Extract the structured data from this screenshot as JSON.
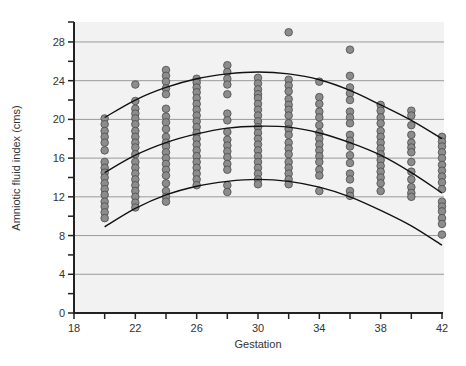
{
  "chart_data": {
    "type": "scatter",
    "title": "",
    "xlabel": "Gestation",
    "ylabel": "Amniotic fluid index (cms)",
    "xlim": [
      18,
      42
    ],
    "ylim": [
      0,
      30
    ],
    "x_ticks": [
      18,
      20,
      22,
      24,
      26,
      28,
      30,
      32,
      34,
      36,
      38,
      40,
      42
    ],
    "x_tick_labels": [
      "18",
      "22",
      "26",
      "30",
      "34",
      "38",
      "42"
    ],
    "x_tick_label_values": [
      18,
      22,
      26,
      30,
      34,
      38,
      42
    ],
    "y_ticks": [
      0,
      2,
      4,
      6,
      8,
      10,
      12,
      14,
      16,
      18,
      20,
      22,
      24,
      26,
      28
    ],
    "y_tick_labels": [
      "0",
      "4",
      "8",
      "12",
      "16",
      "20",
      "24",
      "28"
    ],
    "y_tick_label_values": [
      0,
      4,
      8,
      12,
      16,
      20,
      24,
      28
    ],
    "grid": {
      "horizontal": true,
      "values": [
        4,
        8,
        12,
        16,
        20,
        24,
        28
      ]
    },
    "legend": null,
    "series": [
      {
        "name": "observations",
        "points_by_x": {
          "20": [
            20.1,
            19.5,
            18.8,
            18.2,
            17.6,
            16.8,
            15.6,
            15.0,
            14.5,
            14.0,
            13.4,
            12.8,
            12.2,
            11.5,
            11.0,
            10.4,
            9.8
          ],
          "22": [
            23.6,
            21.9,
            21.1,
            20.6,
            20.1,
            19.5,
            18.8,
            18.2,
            17.6,
            17.1,
            16.4,
            15.6,
            15.0,
            14.4,
            13.8,
            13.2,
            12.6,
            12.0,
            11.4,
            10.9
          ],
          "24": [
            25.1,
            24.5,
            23.9,
            23.2,
            22.6,
            21.1,
            20.3,
            19.7,
            19.0,
            18.2,
            17.6,
            17.2,
            16.6,
            16.0,
            15.4,
            14.8,
            14.2,
            13.4,
            12.6,
            12.0,
            11.5
          ],
          "26": [
            24.2,
            23.8,
            23.3,
            22.8,
            22.2,
            21.6,
            21.0,
            20.4,
            19.8,
            19.2,
            18.6,
            18.0,
            17.4,
            16.8,
            16.2,
            15.6,
            15.0,
            14.4,
            13.8,
            13.2
          ],
          "28": [
            25.6,
            24.9,
            24.2,
            23.6,
            22.6,
            20.6,
            19.9,
            18.7,
            17.9,
            17.3,
            16.7,
            16.1,
            15.4,
            14.8,
            13.2,
            12.5
          ],
          "30": [
            24.3,
            23.7,
            23.1,
            22.6,
            22.2,
            21.6,
            21.0,
            20.4,
            19.8,
            19.2,
            18.6,
            18.0,
            17.4,
            16.8,
            16.2,
            15.6,
            15.0,
            14.4,
            13.8,
            13.3
          ],
          "32": [
            29.0,
            24.1,
            23.5,
            22.9,
            22.1,
            21.5,
            21.0,
            20.4,
            19.6,
            19.0,
            18.4,
            17.6,
            17.0,
            16.4,
            15.6,
            15.0,
            14.4,
            13.8,
            13.3
          ],
          "34": [
            23.9,
            22.3,
            21.6,
            20.8,
            20.2,
            19.4,
            18.6,
            18.0,
            17.4,
            16.8,
            16.2,
            15.6,
            14.8,
            14.2,
            12.6
          ],
          "36": [
            27.2,
            24.5,
            23.3,
            22.7,
            22.0,
            20.8,
            20.2,
            19.6,
            18.4,
            17.8,
            17.2,
            16.3,
            15.5,
            14.4,
            13.8,
            12.6,
            12.1
          ],
          "38": [
            21.5,
            20.9,
            20.2,
            19.6,
            18.8,
            18.2,
            17.6,
            17.0,
            16.4,
            15.8,
            15.2,
            14.6,
            14.0,
            13.4,
            12.6
          ],
          "40": [
            20.9,
            20.4,
            19.4,
            18.4,
            17.6,
            17.1,
            16.6,
            15.6,
            14.6,
            13.8,
            13.0,
            12.4,
            12.0
          ],
          "42": [
            18.2,
            17.7,
            17.2,
            16.6,
            16.0,
            15.3,
            14.7,
            14.1,
            13.5,
            12.8,
            11.5,
            11.0,
            10.5,
            9.8,
            9.2,
            8.1
          ]
        }
      }
    ],
    "curves": [
      {
        "name": "upper",
        "x": [
          20,
          22,
          24,
          26,
          28,
          30,
          32,
          34,
          36,
          38,
          40,
          42
        ],
        "y": [
          20.2,
          22.0,
          23.3,
          24.2,
          24.7,
          24.9,
          24.7,
          24.1,
          23.0,
          21.5,
          19.9,
          18.0
        ]
      },
      {
        "name": "median",
        "x": [
          20,
          22,
          24,
          26,
          28,
          30,
          32,
          34,
          36,
          38,
          40,
          42
        ],
        "y": [
          14.5,
          16.3,
          17.6,
          18.5,
          19.1,
          19.3,
          19.2,
          18.6,
          17.6,
          16.3,
          14.5,
          12.4
        ]
      },
      {
        "name": "lower",
        "x": [
          20,
          22,
          24,
          26,
          28,
          30,
          32,
          34,
          36,
          38,
          40,
          42
        ],
        "y": [
          8.9,
          10.8,
          12.2,
          13.1,
          13.6,
          13.8,
          13.6,
          13.0,
          12.0,
          10.6,
          9.0,
          7.0
        ]
      }
    ]
  },
  "style": {
    "background": "#ffffff",
    "plot_background": "#f2f2f2",
    "grid_color": "#9a9a9a",
    "axis_color": "#222222",
    "dot_fill": "#8c8c8c",
    "dot_stroke": "#4a4a4a",
    "curve_color": "#111111"
  }
}
